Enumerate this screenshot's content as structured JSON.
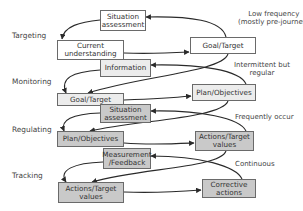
{
  "diagram": {
    "title": "",
    "levels": [
      {
        "id": "targeting",
        "label": "Targeting"
      },
      {
        "id": "monitoring",
        "label": "Monitoring"
      },
      {
        "id": "regulating",
        "label": "Regulating"
      },
      {
        "id": "tracking",
        "label": "Tracking"
      }
    ],
    "nodes": {
      "situation_assessment_top": {
        "line1": "Situation",
        "line2": "assessment",
        "fill": "#ffffff"
      },
      "current_understanding": {
        "line1": "Current",
        "line2": "understanding",
        "fill": "#ffffff"
      },
      "information": {
        "line1": "Information",
        "fill": "#ececec"
      },
      "goal_target_right": {
        "line1": "Goal/Target",
        "fill": "#ffffff"
      },
      "goal_target_left": {
        "line1": "Goal/Target",
        "fill": "#ececec"
      },
      "situation_assessment_mid": {
        "line1": "Situation",
        "line2": "assessment",
        "fill": "#c9c9c9"
      },
      "plan_objectives_right": {
        "line1": "Plan/Objectives",
        "fill": "#ececec"
      },
      "plan_objectives_left": {
        "line1": "Plan/Objectives",
        "fill": "#c9c9c9"
      },
      "measurement_feedback": {
        "line1": "Measurement",
        "line2": "/Feedback",
        "fill": "#c9c9c9"
      },
      "actions_target_right": {
        "line1": "Actions/Target",
        "line2": "values",
        "fill": "#c9c9c9"
      },
      "actions_target_left": {
        "line1": "Actions/Target",
        "line2": "values",
        "fill": "#c9c9c9"
      },
      "corrective_actions": {
        "line1": "Corrective",
        "line2": "actions",
        "fill": "#c9c9c9"
      }
    },
    "frequency_notes": [
      {
        "id": "low",
        "line1": "Low frequency",
        "line2": "(mostly pre-journey)"
      },
      {
        "id": "intermittent",
        "line1": "Intermittent but",
        "line2": "regular"
      },
      {
        "id": "frequent",
        "line1": "Frequently occur"
      },
      {
        "id": "continuous",
        "line1": "Continuous"
      }
    ],
    "colors": {
      "stroke": "#2a2a2a",
      "box_border": "#6a6a6a",
      "white_fill": "#ffffff",
      "light_fill": "#ececec",
      "gray_fill": "#c9c9c9"
    }
  }
}
